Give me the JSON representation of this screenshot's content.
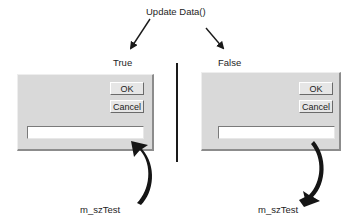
{
  "diagram": {
    "title": "Update Data()",
    "branches": [
      {
        "condition": "True",
        "dialog": {
          "ok_label": "OK",
          "cancel_label": "Cancel",
          "edit_value": ""
        },
        "variable": "m_szTest",
        "flow": "variable-to-control"
      },
      {
        "condition": "False",
        "dialog": {
          "ok_label": "OK",
          "cancel_label": "Cancel",
          "edit_value": ""
        },
        "variable": "m_szTest",
        "flow": "control-to-variable"
      }
    ],
    "colors": {
      "dialog_face": "#d9d9d9",
      "arrow": "#1a1a1a",
      "text": "#1e1e1e"
    }
  }
}
